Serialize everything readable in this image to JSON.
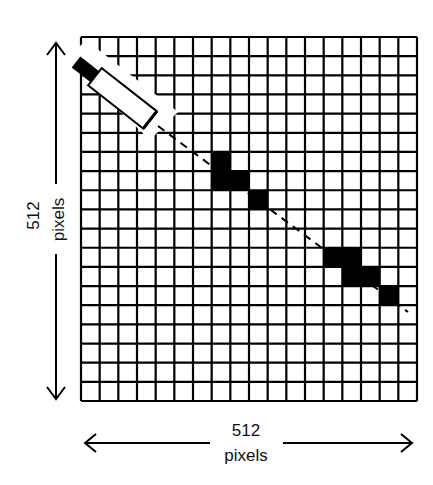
{
  "diagram": {
    "grid": {
      "columns": 18,
      "rows": 19,
      "left": 81,
      "top": 37,
      "right": 417,
      "bottom": 401,
      "line_color": "#000000"
    },
    "filled_cells": [
      {
        "col": 7,
        "row": 6
      },
      {
        "col": 7,
        "row": 7
      },
      {
        "col": 8,
        "row": 7
      },
      {
        "col": 9,
        "row": 8
      },
      {
        "col": 13,
        "row": 11
      },
      {
        "col": 14,
        "row": 11
      },
      {
        "col": 14,
        "row": 12
      },
      {
        "col": 15,
        "row": 12
      },
      {
        "col": 16,
        "row": 13
      }
    ],
    "scan_line": {
      "style": "dashed",
      "x1": 158,
      "y1": 126,
      "x2": 408,
      "y2": 312
    },
    "scanner_device": {
      "shape": "cylinder",
      "cap_color": "#000000",
      "body_color": "#ffffff",
      "angle_deg": 38
    },
    "vertical_dimension": {
      "value": "512",
      "unit": "pixels",
      "direction": "up-down"
    },
    "horizontal_dimension": {
      "value": "512",
      "unit": "pixels",
      "direction": "left-right"
    }
  }
}
